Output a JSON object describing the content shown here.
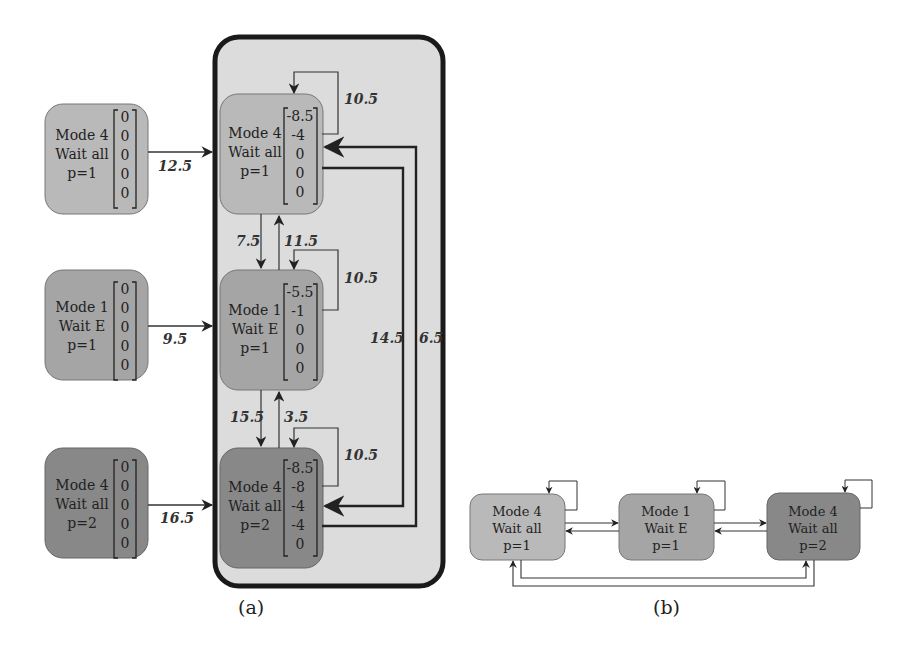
{
  "colors": {
    "light_node": "#b9b9b9",
    "mid_node": "#a5a5a5",
    "dark_node": "#888888",
    "container_fill": "#dcdcdc",
    "stroke": "#222222",
    "edge": "#333333"
  },
  "panel_a": {
    "caption": "(a)",
    "inputs": [
      {
        "mode": "Mode 4",
        "wait": "Wait all",
        "p": "p=1",
        "vector": [
          "0",
          "0",
          "0",
          "0",
          "0"
        ],
        "edge_label": "12.5"
      },
      {
        "mode": "Mode 1",
        "wait": "Wait E",
        "p": "p=1",
        "vector": [
          "0",
          "0",
          "0",
          "0",
          "0"
        ],
        "edge_label": "9.5"
      },
      {
        "mode": "Mode 4",
        "wait": "Wait all",
        "p": "p=2",
        "vector": [
          "0",
          "0",
          "0",
          "0",
          "0"
        ],
        "edge_label": "16.5"
      }
    ],
    "states": [
      {
        "mode": "Mode 4",
        "wait": "Wait all",
        "p": "p=1",
        "vector": [
          "-8.5",
          "-4",
          "0",
          "0",
          "0"
        ],
        "self_loop": "10.5"
      },
      {
        "mode": "Mode 1",
        "wait": "Wait E",
        "p": "p=1",
        "vector": [
          "-5.5",
          "-1",
          "0",
          "0",
          "0"
        ],
        "self_loop": "10.5"
      },
      {
        "mode": "Mode 4",
        "wait": "Wait all",
        "p": "p=2",
        "vector": [
          "-8.5",
          "-8",
          "-4",
          "-4",
          "0"
        ],
        "self_loop": "10.5"
      }
    ],
    "transitions": {
      "s1_to_s2": "7.5",
      "s2_to_s1": "11.5",
      "s2_to_s3": "15.5",
      "s3_to_s2": "3.5",
      "s1_to_s3": "14.5",
      "s3_to_s1": "6.5"
    }
  },
  "panel_b": {
    "caption": "(b)",
    "nodes": [
      {
        "mode": "Mode 4",
        "wait": "Wait all",
        "p": "p=1"
      },
      {
        "mode": "Mode 1",
        "wait": "Wait E",
        "p": "p=1"
      },
      {
        "mode": "Mode 4",
        "wait": "Wait all",
        "p": "p=2"
      }
    ]
  }
}
